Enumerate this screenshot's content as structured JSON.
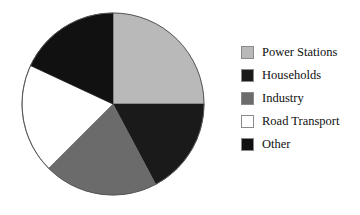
{
  "chart_data": {
    "type": "pie",
    "title": "",
    "legend_position": "right",
    "categories": [
      "Power Stations",
      "Households",
      "Industry",
      "Road Transport",
      "Other"
    ],
    "values": [
      25,
      17,
      20,
      19,
      18
    ],
    "units": "percent",
    "start_angle_deg": 0,
    "direction": "clockwise",
    "slices": [
      {
        "label": "Power Stations",
        "value": 25,
        "color": "#b9b9b9",
        "start_deg": 0,
        "end_deg": 90
      },
      {
        "label": "Households",
        "value": 17,
        "color": "#1a1a1a",
        "start_deg": 90,
        "end_deg": 152
      },
      {
        "label": "Industry",
        "value": 20,
        "color": "#6b6b6b",
        "start_deg": 152,
        "end_deg": 225
      },
      {
        "label": "Road Transport",
        "value": 19,
        "color": "#ffffff",
        "start_deg": 225,
        "end_deg": 295
      },
      {
        "label": "Other",
        "value": 18,
        "color": "#111111",
        "start_deg": 295,
        "end_deg": 360
      }
    ],
    "xlabel": "",
    "ylabel": ""
  },
  "pie": {
    "center_x": 113,
    "center_y": 104,
    "radius": 91,
    "outline_color": "#555555"
  },
  "legend": {
    "items": [
      {
        "label": "Power Stations",
        "color": "#b9b9b9"
      },
      {
        "label": "Households",
        "color": "#1a1a1a"
      },
      {
        "label": "Industry",
        "color": "#6b6b6b"
      },
      {
        "label": "Road Transport",
        "color": "#ffffff"
      },
      {
        "label": "Other",
        "color": "#111111"
      }
    ]
  }
}
